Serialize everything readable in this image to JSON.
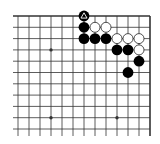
{
  "diagram": {
    "type": "go-board-corner",
    "visible_region": "top-right corner",
    "columns_visible": 13,
    "rows_visible": 11,
    "edges": [
      "top",
      "right"
    ],
    "colors": {
      "background": "#ffffff",
      "line": "#333333",
      "black_stone": "#000000",
      "white_stone": "#ffffff",
      "white_stone_border": "#222222"
    },
    "star_points": [
      {
        "col": 3,
        "row": 3
      },
      {
        "col": 3,
        "row": 9
      },
      {
        "col": 9,
        "row": 9
      }
    ],
    "stones": [
      {
        "color": "black",
        "col": 6,
        "row": 0,
        "marker": "triangle"
      },
      {
        "color": "black",
        "col": 6,
        "row": 1
      },
      {
        "color": "white",
        "col": 7,
        "row": 1
      },
      {
        "color": "white",
        "col": 8,
        "row": 1
      },
      {
        "color": "black",
        "col": 6,
        "row": 2
      },
      {
        "color": "black",
        "col": 7,
        "row": 2
      },
      {
        "color": "black",
        "col": 8,
        "row": 2
      },
      {
        "color": "white",
        "col": 9,
        "row": 2
      },
      {
        "color": "white",
        "col": 10,
        "row": 2
      },
      {
        "color": "white",
        "col": 11,
        "row": 2
      },
      {
        "color": "black",
        "col": 9,
        "row": 3
      },
      {
        "color": "black",
        "col": 10,
        "row": 3
      },
      {
        "color": "white",
        "col": 11,
        "row": 3
      },
      {
        "color": "black",
        "col": 11,
        "row": 4
      },
      {
        "color": "black",
        "col": 10,
        "row": 5
      }
    ]
  }
}
